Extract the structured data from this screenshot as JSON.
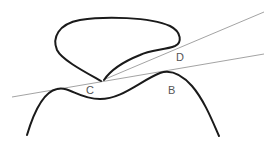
{
  "diagram": {
    "type": "geometry-curve-tangents",
    "labels": [
      {
        "id": "C",
        "text": "C",
        "x": 86,
        "y": 94
      },
      {
        "id": "D",
        "text": "D",
        "x": 176,
        "y": 61
      },
      {
        "id": "B",
        "text": "B",
        "x": 168,
        "y": 94
      }
    ],
    "colors": {
      "curve": "#1a1a1a",
      "line": "#999999",
      "label": "#555555",
      "background": "#ffffff"
    }
  }
}
